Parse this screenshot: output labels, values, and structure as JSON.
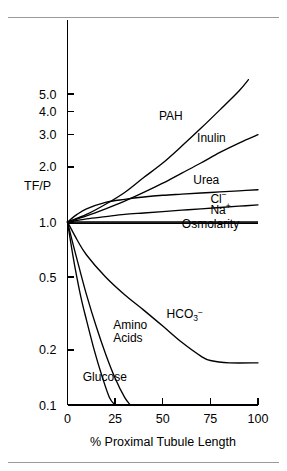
{
  "figure": {
    "name": "tf-p-proximal-tubule-figure",
    "has_top_rule": true,
    "has_bottom_rule": true
  },
  "chart_data": {
    "type": "line",
    "title": "",
    "xlabel": "% Proximal Tubule Length",
    "ylabel": "TF/P",
    "xlim": [
      0,
      100
    ],
    "ylim": [
      0.1,
      6.0
    ],
    "yscale": "log",
    "grid": false,
    "legend": "inline-labels",
    "xticks": [
      0,
      25,
      50,
      75,
      100
    ],
    "xtick_labels": [
      "0",
      "25",
      "50",
      "75",
      "100"
    ],
    "yticks": [
      5.0,
      4.0,
      3.0,
      2.0,
      1.0,
      0.5,
      0.2,
      0.1
    ],
    "ytick_labels": [
      "5.0",
      "4.0",
      "3.0",
      "2.0",
      "1.0",
      "0.5",
      "0.2",
      "0.1"
    ],
    "series": [
      {
        "name": "PAH",
        "label": "PAH",
        "label_x": 48,
        "label_y": 3.6,
        "x": [
          0,
          10,
          20,
          30,
          40,
          50,
          60,
          70,
          80,
          90,
          95
        ],
        "values": [
          1.0,
          1.1,
          1.25,
          1.45,
          1.75,
          2.1,
          2.6,
          3.25,
          4.1,
          5.2,
          6.0
        ]
      },
      {
        "name": "Inulin",
        "label": "Inulin",
        "label_x": 68,
        "label_y": 2.75,
        "x": [
          0,
          10,
          20,
          30,
          40,
          50,
          60,
          70,
          80,
          90,
          100
        ],
        "values": [
          1.0,
          1.08,
          1.18,
          1.3,
          1.45,
          1.63,
          1.85,
          2.1,
          2.4,
          2.7,
          3.0
        ]
      },
      {
        "name": "Urea",
        "label": "Urea",
        "label_x": 66,
        "label_y": 1.62,
        "x": [
          0,
          5,
          10,
          20,
          30,
          40,
          50,
          60,
          70,
          80,
          90,
          100
        ],
        "values": [
          1.0,
          1.1,
          1.18,
          1.28,
          1.33,
          1.37,
          1.4,
          1.42,
          1.44,
          1.46,
          1.48,
          1.5
        ]
      },
      {
        "name": "Cl",
        "label": "Cl⁻",
        "label_x": 75,
        "label_y": 1.27,
        "x": [
          0,
          10,
          20,
          30,
          40,
          50,
          60,
          70,
          80,
          90,
          100
        ],
        "values": [
          1.0,
          1.04,
          1.07,
          1.1,
          1.12,
          1.14,
          1.16,
          1.18,
          1.2,
          1.22,
          1.24
        ]
      },
      {
        "name": "Na",
        "label": "Na⁺",
        "label_x": 75,
        "label_y": 1.1,
        "x": [
          0,
          25,
          50,
          75,
          100
        ],
        "values": [
          1.0,
          1.0,
          1.0,
          1.0,
          1.0
        ]
      },
      {
        "name": "Osmolarity",
        "label": "Osmolarity",
        "label_x": 60,
        "label_y": 0.93,
        "x": [
          0,
          25,
          50,
          75,
          100
        ],
        "values": [
          0.985,
          0.985,
          0.985,
          0.985,
          0.985
        ]
      },
      {
        "name": "HCO3",
        "label": "HCO₃⁻",
        "label_x": 52,
        "label_y": 0.3,
        "x": [
          0,
          5,
          10,
          20,
          30,
          40,
          50,
          60,
          70,
          75,
          85,
          100
        ],
        "values": [
          1.0,
          0.8,
          0.66,
          0.5,
          0.4,
          0.33,
          0.27,
          0.22,
          0.185,
          0.175,
          0.17,
          0.17
        ]
      },
      {
        "name": "Amino Acids",
        "label": "Amino Acids",
        "label_line1": "Amino",
        "label_line2": "Acids",
        "label_x": 24,
        "label_y": 0.26,
        "x": [
          0,
          3,
          6,
          10,
          15,
          20,
          25,
          30,
          33
        ],
        "values": [
          1.0,
          0.75,
          0.57,
          0.4,
          0.27,
          0.19,
          0.14,
          0.11,
          0.1
        ]
      },
      {
        "name": "Glucose",
        "label": "Glucose",
        "label_x": 8,
        "label_y": 0.135,
        "x": [
          0,
          2,
          4,
          7,
          10,
          14,
          18,
          22,
          25
        ],
        "values": [
          1.0,
          0.74,
          0.56,
          0.39,
          0.29,
          0.2,
          0.145,
          0.11,
          0.1
        ]
      }
    ]
  }
}
